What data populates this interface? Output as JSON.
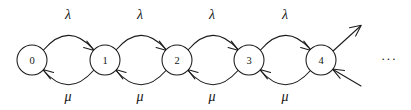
{
  "diagram": {
    "type": "markov-chain-state-transition",
    "canvas": {
      "width": 411,
      "height": 110,
      "background": "#ffffff"
    },
    "stroke_color": "#1a1a1a",
    "text_color": "#141414",
    "states": [
      {
        "id": "s0",
        "label": "0",
        "cx": 32,
        "cy": 60,
        "r": 15
      },
      {
        "id": "s1",
        "label": "1",
        "cx": 105,
        "cy": 60,
        "r": 15
      },
      {
        "id": "s2",
        "label": "2",
        "cx": 177,
        "cy": 60,
        "r": 15
      },
      {
        "id": "s3",
        "label": "3",
        "cx": 249,
        "cy": 60,
        "r": 15
      },
      {
        "id": "s4",
        "label": "4",
        "cx": 321,
        "cy": 60,
        "r": 15
      }
    ],
    "forward_transitions": [
      {
        "from": "0",
        "to": "1",
        "rate": "λ",
        "label_x": 68,
        "label_y": 14
      },
      {
        "from": "1",
        "to": "2",
        "rate": "λ",
        "label_x": 140,
        "label_y": 14
      },
      {
        "from": "2",
        "to": "3",
        "rate": "λ",
        "label_x": 212,
        "label_y": 14
      },
      {
        "from": "3",
        "to": "4",
        "rate": "λ",
        "label_x": 285,
        "label_y": 14
      }
    ],
    "backward_transitions": [
      {
        "from": "1",
        "to": "0",
        "rate": "μ",
        "label_x": 68,
        "label_y": 96
      },
      {
        "from": "2",
        "to": "1",
        "rate": "μ",
        "label_x": 140,
        "label_y": 96
      },
      {
        "from": "3",
        "to": "2",
        "rate": "μ",
        "label_x": 212,
        "label_y": 96
      },
      {
        "from": "4",
        "to": "3",
        "rate": "μ",
        "label_x": 285,
        "label_y": 96
      }
    ],
    "open_edges": [
      {
        "id": "out-right",
        "direction": "outgoing",
        "from": "4",
        "to": "beyond"
      },
      {
        "id": "in-right",
        "direction": "incoming",
        "from": "beyond",
        "to": "4"
      }
    ],
    "continuation": {
      "label": "···",
      "x": 389,
      "y": 58
    }
  }
}
